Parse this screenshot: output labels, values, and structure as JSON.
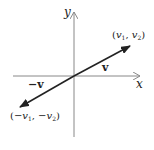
{
  "diagram": {
    "type": "vector-coordinate-plot",
    "axes": {
      "x_label": "x",
      "y_label": "y",
      "origin": [
        74,
        76
      ],
      "axis_color": "#888888"
    },
    "vectors": [
      {
        "name": "v",
        "label": "v",
        "from": [
          74,
          76
        ],
        "to": [
          130,
          46
        ],
        "tip_label_parts": [
          "(",
          "v",
          "1",
          ", ",
          "v",
          "2",
          ")"
        ]
      },
      {
        "name": "neg-v",
        "label": "−v",
        "from": [
          74,
          76
        ],
        "to": [
          20,
          107
        ],
        "tip_label_parts": [
          "(−",
          "v",
          "1",
          ", −",
          "v",
          "2",
          ")"
        ]
      }
    ],
    "vector_color": "#222222",
    "labels": {
      "y": "y",
      "x": "x",
      "v": "v",
      "neg_v": "−v",
      "tip_pos": {
        "open": "(",
        "v1": "v",
        "s1": "1",
        "sep": ", ",
        "v2": "v",
        "s2": "2",
        "close": ")"
      },
      "tip_neg": {
        "open": "(−",
        "v1": "v",
        "s1": "1",
        "sep": ", −",
        "v2": "v",
        "s2": "2",
        "close": ")"
      }
    }
  }
}
